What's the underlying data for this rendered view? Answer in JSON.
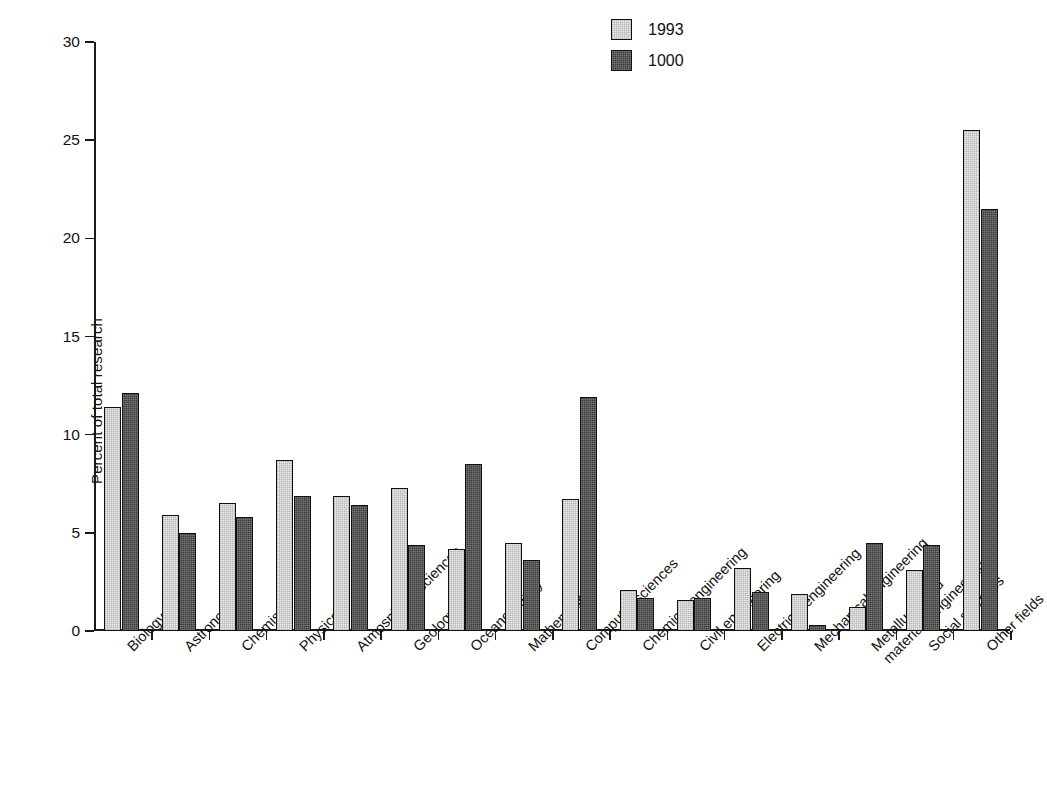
{
  "chart_data": {
    "type": "bar",
    "title": "",
    "xlabel": "",
    "ylabel": "Percent of total research",
    "ylim": [
      0,
      30
    ],
    "ytick_labels": [
      "0",
      "5",
      "10",
      "15",
      "20",
      "25",
      "30"
    ],
    "ytick_values": [
      0,
      5,
      10,
      15,
      20,
      25,
      30
    ],
    "grid": false,
    "legend_position": "top-center",
    "categories": [
      "Biology",
      "Astronomy",
      "Chemistry",
      "Physics",
      "Atmospheric sciences",
      "Geology",
      "Oceanography",
      "Mathematics",
      "Computer sciences",
      "Chemical engineering",
      "Civil engineering",
      "Electrical engineering",
      "Mechanical engineering",
      "Metallurgy and\nmaterials engineering",
      "Social sciences",
      "Other fields"
    ],
    "series": [
      {
        "name": "1993",
        "color": "#ebebeb",
        "values": [
          11.4,
          5.9,
          6.5,
          8.7,
          6.9,
          7.3,
          4.2,
          4.5,
          6.7,
          2.1,
          1.6,
          3.2,
          1.9,
          1.2,
          3.1,
          25.5
        ]
      },
      {
        "name": "1000",
        "color": "#3b3b3b",
        "values": [
          12.1,
          5.0,
          5.8,
          6.9,
          6.4,
          4.4,
          8.5,
          3.6,
          11.9,
          1.7,
          1.7,
          2.0,
          0.3,
          4.5,
          4.4,
          21.5
        ]
      }
    ]
  }
}
